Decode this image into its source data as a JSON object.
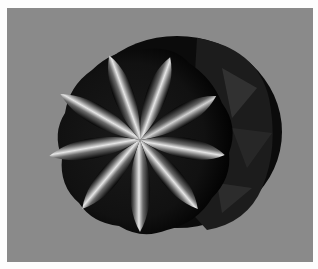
{
  "image": {
    "subject": "rendered 3D rosette surface",
    "petal_count": 9,
    "colors": {
      "border": "#fdfdfd",
      "background": "#8a8a8a",
      "shadow": "#050505",
      "highlight": "#e8e8e8",
      "mid": "#555555"
    }
  }
}
